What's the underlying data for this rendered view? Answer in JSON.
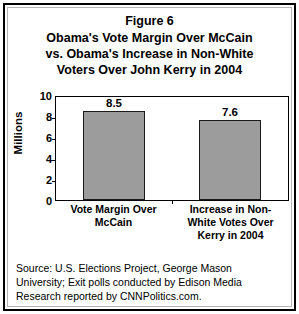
{
  "chart_data": {
    "type": "bar",
    "title": "Obama's Vote Margin Over McCain vs. Obama's Increase in Non-White Voters Over John Kerry in 2004",
    "title_lines": [
      "Figure 6",
      "Obama's Vote Margin Over McCain",
      "vs. Obama's Increase in Non-White",
      "Voters Over John Kerry in 2004"
    ],
    "figure_number": "Figure 6",
    "categories": [
      "Vote Margin Over McCain",
      "Increase in Non-White Votes Over Kerry in 2004"
    ],
    "category_label_lines": [
      [
        "Vote Margin Over",
        "McCain"
      ],
      [
        "Increase in Non-",
        "White Votes Over",
        "Kerry in 2004"
      ]
    ],
    "values": [
      8.5,
      7.6
    ],
    "value_labels": [
      "8.5",
      "7.6"
    ],
    "xlabel": "",
    "ylabel": "Millions",
    "ylim": [
      0,
      10
    ],
    "ytick_values": [
      0,
      2,
      4,
      6,
      8,
      10
    ],
    "ytick_labels": [
      "0",
      "2",
      "4",
      "6",
      "8",
      "10"
    ],
    "grid": false,
    "legend": false,
    "bar_color": "#9c9c9c",
    "bar_border_color": "#1a1a1a",
    "axis_color": "#000000",
    "background_color": "#ffffff"
  },
  "source_note": {
    "lines": [
      "Source: U.S. Elections Project, George Mason",
      "University; Exit polls conducted by Edison Media",
      "Research reported by CNNPolitics.com."
    ]
  }
}
